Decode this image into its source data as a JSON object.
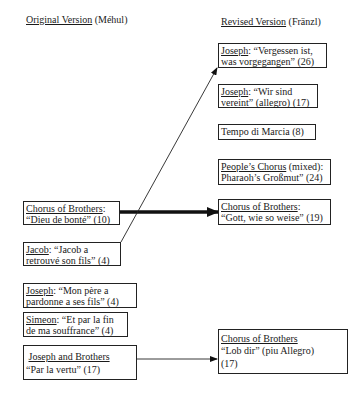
{
  "headings": {
    "original": {
      "title": "Original Version",
      "composer": "(Méhul)"
    },
    "revised": {
      "title": "Revised Version",
      "composer": "(Fränzl)"
    }
  },
  "original_items": [
    {
      "singer": "Chorus of Brothers",
      "sep": ":",
      "text": "“Dieu de bonté” (10)"
    },
    {
      "singer": "Jacob",
      "sep": ":  “Jacob a",
      "text": "retrouvé son fils” (4)"
    },
    {
      "singer": "Joseph",
      "sep": ":  “Mon père a",
      "text": "pardonne a ses fils” (4)"
    },
    {
      "singer": "Simeon",
      "sep": ":  “Et par la fin",
      "text": "de ma souffrance” (4)"
    },
    {
      "singer": "Joseph and Brothers",
      "sep": "",
      "text": "“Par la vertu” (17)"
    }
  ],
  "revised_items": [
    {
      "singer": "Joseph",
      "sep": ":  “Vergessen ist,",
      "text": "was vorgegangen” (26)"
    },
    {
      "singer": "Joseph",
      "sep": ":  “Wir sind",
      "text": "vereint” (allegro) (17)"
    },
    {
      "singer": "",
      "sep": "Tempo di Marcia (8)",
      "text": ""
    },
    {
      "singer": "People’s Chorus",
      "sep": " (mixed):",
      "text": "Pharaoh’s Großmut” (24)"
    },
    {
      "singer": "Chorus of Brothers",
      "sep": ":",
      "text": "“Gott, wie so weise” (19)"
    },
    {
      "singer": "Chorus of Brothers",
      "sep": "",
      "text": "“Lob dir” (piu Allegro)",
      "text2": "(17)"
    }
  ],
  "connections": [
    {
      "from": "Chorus of Brothers: Dieu de bonté",
      "to": "Chorus of Brothers: Gott, wie so weise",
      "style": "thick-arrow"
    },
    {
      "from": "Jacob: Jacob a retrouvé son fils",
      "to": "Joseph: Vergessen ist, was vorgegangen",
      "style": "thin-arrow"
    },
    {
      "from": "Joseph and Brothers: Par la vertu",
      "to": "Chorus of Brothers: Lob dir",
      "style": "thin-arrow"
    }
  ]
}
